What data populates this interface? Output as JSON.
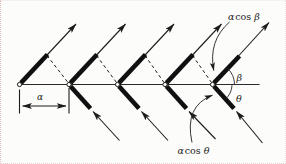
{
  "figure": {
    "ink_color": "#1c1c1c",
    "background_color": "#fcfcfa",
    "labels": {
      "spacing": "α",
      "beta": "β",
      "theta": "θ",
      "upper_projection": {
        "coef": "α",
        "fn": "cos",
        "angle": "β"
      },
      "lower_projection": {
        "coef": "α",
        "fn": "cos",
        "angle": "θ"
      }
    }
  }
}
